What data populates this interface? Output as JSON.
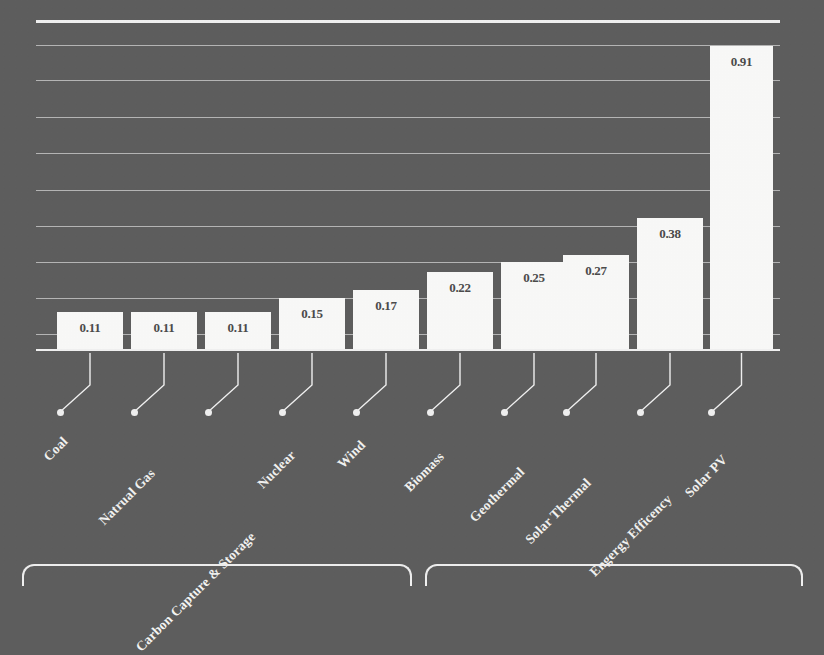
{
  "chart_data": {
    "type": "bar",
    "title": "",
    "subtitle": "",
    "xlabel": "",
    "ylabel": "",
    "ylim": [
      0,
      1.0
    ],
    "grid": true,
    "legend": false,
    "orientation": "vertical",
    "bar_color": "#fbfbfa",
    "background_color": "#5d5d5d",
    "axis_color": "#f2f2f2",
    "label_color": "#f4f4f2",
    "value_label_color": "#4a4a4a",
    "gridline_count": 10,
    "categories": [
      "Coal",
      "Natrual Gas",
      "Carbon Capture & Storage",
      "Nuclear",
      "Wind",
      "Biomass",
      "Geothermal",
      "Solar Thermal",
      "Engergy Efficency",
      "Solar PV"
    ],
    "values": [
      0.11,
      0.11,
      0.11,
      0.15,
      0.17,
      0.22,
      0.25,
      0.27,
      0.38,
      0.91
    ],
    "value_labels": [
      "0.11",
      "0.11",
      "0.11",
      "0.15",
      "0.17",
      "0.22",
      "0.25",
      "0.27",
      "0.38",
      "0.91"
    ],
    "tick_labels": []
  },
  "bars": [
    {
      "label": "Coal",
      "value": "0.11",
      "x": 57,
      "w": 66,
      "top": 312
    },
    {
      "label": "Natrual Gas",
      "value": "0.11",
      "x": 131,
      "w": 66,
      "top": 312
    },
    {
      "label": "Carbon Capture & Storage",
      "value": "0.11",
      "x": 205,
      "w": 66,
      "top": 312
    },
    {
      "label": "Nuclear",
      "value": "0.15",
      "x": 279,
      "w": 66,
      "top": 298
    },
    {
      "label": "Wind",
      "value": "0.17",
      "x": 353,
      "w": 66,
      "top": 290
    },
    {
      "label": "Biomass",
      "value": "0.22",
      "x": 427,
      "w": 66,
      "top": 272
    },
    {
      "label": "Geothermal",
      "value": "0.25",
      "x": 501,
      "w": 66,
      "top": 262
    },
    {
      "label": "Solar Thermal",
      "value": "0.27",
      "x": 563,
      "w": 66,
      "top": 255
    },
    {
      "label": "Engergy Efficency",
      "value": "0.38",
      "x": 637,
      "w": 66,
      "top": 218
    },
    {
      "label": "Solar PV",
      "value": "0.91",
      "x": 710,
      "w": 63,
      "top": 46
    }
  ],
  "gridlines": [
    20,
    45,
    80,
    117,
    153,
    190,
    226,
    262,
    298,
    334
  ],
  "bottom_panels": {
    "left_label": "",
    "right_label": ""
  }
}
